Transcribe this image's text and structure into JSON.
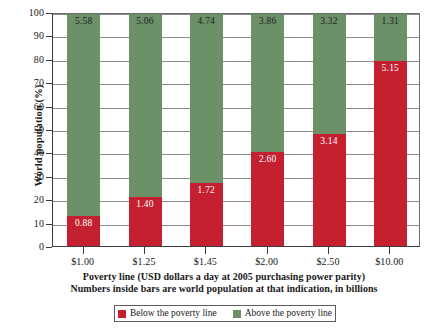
{
  "chart_data": {
    "type": "bar",
    "subtype": "stacked-percentage",
    "title": "",
    "xlabel": "Poverty line (USD dollars a day at 2005 purchasing power parity)",
    "ylabel": "World population (%)",
    "ylim": [
      0,
      100
    ],
    "yticks": [
      "0",
      "10",
      "20",
      "30",
      "40",
      "50",
      "60",
      "70",
      "80",
      "90",
      "100"
    ],
    "grid": true,
    "legend_position": "bottom",
    "categories": [
      "$1.00",
      "$1.25",
      "$1.45",
      "$2.00",
      "$2.50",
      "$10.00"
    ],
    "series": [
      {
        "name": "Below the poverty line",
        "color": "#c42030",
        "values": [
          13,
          21,
          27,
          40,
          48,
          79
        ],
        "labels": [
          "0.88",
          "1.40",
          "1.72",
          "2.60",
          "3.14",
          "5.15"
        ],
        "units": "billions of people"
      },
      {
        "name": "Above the poverty line",
        "color": "#6c9168",
        "values": [
          87,
          79,
          73,
          60,
          52,
          21
        ],
        "labels": [
          "5.58",
          "5.06",
          "4.74",
          "3.86",
          "3.32",
          "1.31"
        ],
        "units": "billions of people"
      }
    ],
    "annotations": [
      "Numbers inside bars are world population at that indication, in billions"
    ]
  },
  "axes": {
    "y_title": "World population (%)",
    "y_ticks": [
      "100",
      "90",
      "80",
      "70",
      "60",
      "50",
      "40",
      "30",
      "20",
      "10",
      "0"
    ],
    "x_ticks": [
      "$1.00",
      "$1.25",
      "$1.45",
      "$2.00",
      "$2.50",
      "$10.00"
    ]
  },
  "caption": {
    "line1": "Poverty line (USD dollars a day at 2005 purchasing power parity)",
    "line2": "Numbers inside bars are world population at that indication, in billions"
  },
  "legend": {
    "items": [
      {
        "label": "Below the poverty line",
        "color": "#c42030"
      },
      {
        "label": "Above the poverty line",
        "color": "#6c9168"
      }
    ]
  },
  "colors": {
    "below": "#c42030",
    "above": "#6c9168",
    "axis": "#3b3b3b",
    "grid": "#8a8a8a",
    "background": "#ffffff"
  }
}
